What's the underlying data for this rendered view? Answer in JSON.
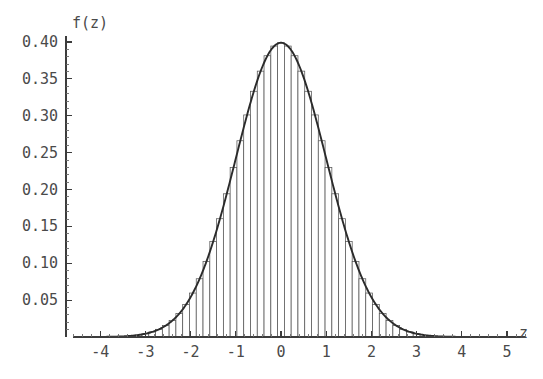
{
  "figure": {
    "background_color": "#ffffff",
    "axis_color": "#3c3c3c",
    "curve_color": "#2b2b2b",
    "bar_stroke_color": "#555555",
    "bar_fill_color": "#ffffff",
    "label_color": "#4a4a4a"
  },
  "chart_data": {
    "type": "bar",
    "title": "",
    "subtitle": "",
    "xlabel": "z",
    "ylabel": "f(z)",
    "xlim": [
      -4.6,
      5.4
    ],
    "ylim": [
      0,
      0.415
    ],
    "grid": false,
    "legend": null,
    "legend_position": "none",
    "x_ticks": [
      -4,
      -3,
      -2,
      -1,
      0,
      1,
      2,
      3,
      4,
      5
    ],
    "x_tick_labels": [
      "-4",
      "-3",
      "-2",
      "-1",
      "0",
      "1",
      "2",
      "3",
      "4",
      "5"
    ],
    "x_minor_tick_step": 0.2,
    "y_ticks": [
      0.05,
      0.1,
      0.15,
      0.2,
      0.25,
      0.3,
      0.35,
      0.4
    ],
    "y_tick_labels": [
      "0.05",
      "0.10",
      "0.15",
      "0.20",
      "0.25",
      "0.30",
      "0.35",
      "0.40"
    ],
    "y_minor_tick_step": 0.01,
    "bar_width": 0.15,
    "bar_edges_start": -3.225,
    "annotations": [],
    "series": [
      {
        "name": "histogram",
        "type": "bar",
        "categories": [
          -3.15,
          -3.0,
          -2.85,
          -2.7,
          -2.55,
          -2.4,
          -2.25,
          -2.1,
          -1.95,
          -1.8,
          -1.65,
          -1.5,
          -1.35,
          -1.2,
          -1.05,
          -0.9,
          -0.75,
          -0.6,
          -0.45,
          -0.3,
          -0.15,
          0.0,
          0.15,
          0.3,
          0.45,
          0.6,
          0.75,
          0.9,
          1.05,
          1.2,
          1.35,
          1.5,
          1.65,
          1.8,
          1.95,
          2.1,
          2.25,
          2.4,
          2.55,
          2.7,
          2.85,
          3.0
        ],
        "values": [
          0.0028,
          0.0044,
          0.0069,
          0.0104,
          0.0155,
          0.0224,
          0.0317,
          0.044,
          0.0596,
          0.079,
          0.1023,
          0.1295,
          0.1604,
          0.1942,
          0.2299,
          0.2661,
          0.3011,
          0.3332,
          0.3605,
          0.3814,
          0.3945,
          0.3989,
          0.3945,
          0.3814,
          0.3605,
          0.3332,
          0.3011,
          0.2661,
          0.2299,
          0.1942,
          0.1604,
          0.1295,
          0.1023,
          0.079,
          0.0596,
          0.044,
          0.0317,
          0.0224,
          0.0155,
          0.0104,
          0.0069,
          0.0044
        ]
      },
      {
        "name": "standard normal density",
        "type": "line",
        "formula": "f(z) = exp(-z^2/2)/sqrt(2*pi)",
        "mean": 0,
        "sd": 1,
        "peak_x": 0,
        "peak_y": 0.3989
      }
    ]
  },
  "caption": {
    "cut_off_text": ""
  }
}
